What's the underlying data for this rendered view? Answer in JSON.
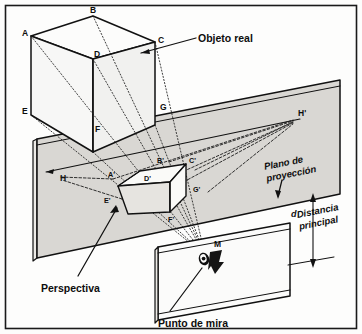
{
  "figure": {
    "background_color": "#fdfdfc",
    "border_color": "#1a1a1a",
    "plane_fill_color": "#d9d7d3",
    "line_color": "#111111"
  },
  "callouts": {
    "objeto_real": "Objeto real",
    "plano_de_proyeccion_line1": "Plano de",
    "plano_de_proyeccion_line2": "proyección",
    "distancia_line1": "Distancia",
    "distancia_line2": "principal",
    "distancia_symbol": "d",
    "perspectiva": "Perspectiva",
    "punto_de_mira": "Punto de mira"
  },
  "object_vertices": [
    {
      "id": "A",
      "label": "A"
    },
    {
      "id": "B",
      "label": "B"
    },
    {
      "id": "C",
      "label": "C"
    },
    {
      "id": "D",
      "label": "D"
    },
    {
      "id": "E",
      "label": "E"
    },
    {
      "id": "F",
      "label": "F"
    },
    {
      "id": "G",
      "label": "G"
    }
  ],
  "projected_vertices": [
    {
      "id": "Ap",
      "label": "A'"
    },
    {
      "id": "Bp",
      "label": "B'"
    },
    {
      "id": "Cp",
      "label": "C'"
    },
    {
      "id": "Dp",
      "label": "D'"
    },
    {
      "id": "Ep",
      "label": "E'"
    },
    {
      "id": "Fp",
      "label": "F'"
    },
    {
      "id": "Gp",
      "label": "G'"
    }
  ],
  "horizon": {
    "left_label": "H",
    "right_label": "H'"
  },
  "viewpoint": {
    "label": "M"
  }
}
